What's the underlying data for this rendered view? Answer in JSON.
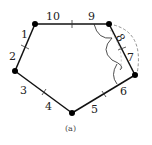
{
  "diagram": {
    "type": "pentagon",
    "caption": "(a)",
    "vertices": [
      "top-left",
      "top-right",
      "right",
      "bottom",
      "left"
    ],
    "labels": {
      "l1": "1",
      "l2": "2",
      "l3": "3",
      "l4": "4",
      "l5": "5",
      "l6": "6",
      "l7": "7",
      "l8": "8",
      "l9": "9",
      "l10": "10"
    },
    "colors": {
      "edge": "#111111",
      "vertex": "#000000",
      "arc": "#222222",
      "dashed_arc": "#666666"
    }
  }
}
